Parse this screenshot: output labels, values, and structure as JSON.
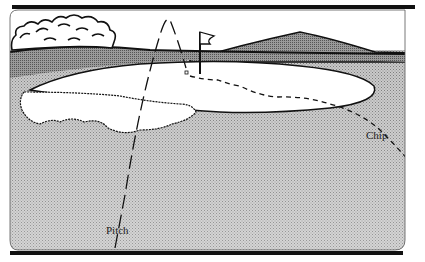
{
  "figure": {
    "labels": {
      "pitch": "Pitch",
      "chip": "Chip"
    },
    "colors": {
      "ink": "#111111",
      "shade": "#a8a8a8",
      "shade_light": "#c4c4c4",
      "background": "#ffffff"
    },
    "elements": [
      "trees",
      "hill",
      "flag",
      "green",
      "bunker",
      "pitch-trajectory",
      "chip-trajectory"
    ]
  }
}
